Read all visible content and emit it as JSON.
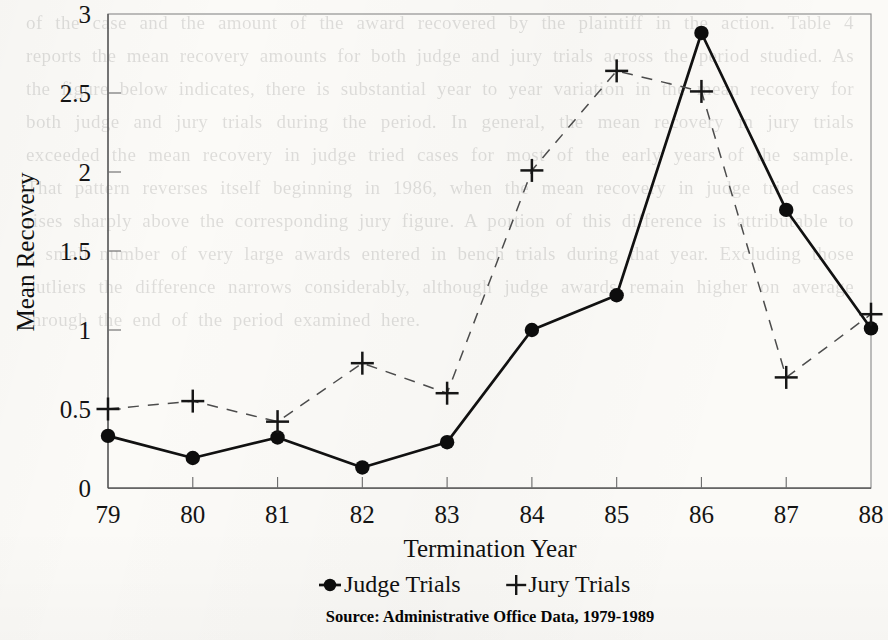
{
  "page": {
    "kind": "scanned-figure",
    "ghost_text": "of the case and the amount of the award recovered by the plaintiff in the action. Table 4 reports the mean recovery amounts for both judge and jury trials across the period studied. As the figure below indicates, there is substantial year to year variation in the mean recovery for both judge and jury trials during the period. In general, the mean recovery in jury trials exceeded the mean recovery in judge tried cases for most of the early years of the sample. That pattern reverses itself beginning in 1986, when the mean recovery in judge tried cases rises sharply above the corresponding jury figure. A portion of this difference is attributable to a small number of very large awards entered in bench trials during that year. Excluding those outliers the difference narrows considerably, although judge awards remain higher on average through the end of the period examined here."
  },
  "chart_data": {
    "type": "line",
    "title": "",
    "xlabel": "Termination Year",
    "ylabel": "Mean Recovery",
    "x": [
      "79",
      "80",
      "81",
      "82",
      "83",
      "84",
      "85",
      "86",
      "87",
      "88"
    ],
    "xtick_labels": [
      "79",
      "80",
      "81",
      "82",
      "83",
      "84",
      "85",
      "86",
      "87",
      "88"
    ],
    "ytick_labels": [
      "0",
      "0.5",
      "1",
      "1.5",
      "2",
      "2.5",
      "3"
    ],
    "ytick_values": [
      0,
      0.5,
      1,
      1.5,
      2,
      2.5,
      3
    ],
    "ylim": [
      0,
      3
    ],
    "grid": false,
    "legend_position": "bottom",
    "series": [
      {
        "name": "Judge Trials",
        "marker": "filled-circle",
        "line_style": "solid",
        "color": "#111111",
        "values": [
          0.33,
          0.19,
          0.32,
          0.13,
          0.29,
          1.0,
          1.22,
          2.88,
          1.76,
          1.01
        ]
      },
      {
        "name": "Jury Trials",
        "marker": "plus",
        "line_style": "dashed",
        "color": "#4c4c4c",
        "values": [
          0.5,
          0.55,
          0.42,
          0.79,
          0.6,
          2.01,
          2.64,
          2.51,
          0.7,
          1.1
        ]
      }
    ]
  },
  "legend": {
    "items": [
      {
        "label": "Judge Trials",
        "marker": "filled-circle"
      },
      {
        "label": "Jury Trials",
        "marker": "plus"
      }
    ]
  },
  "source": {
    "text": "Source: Administrative Office Data, 1979-1989"
  }
}
